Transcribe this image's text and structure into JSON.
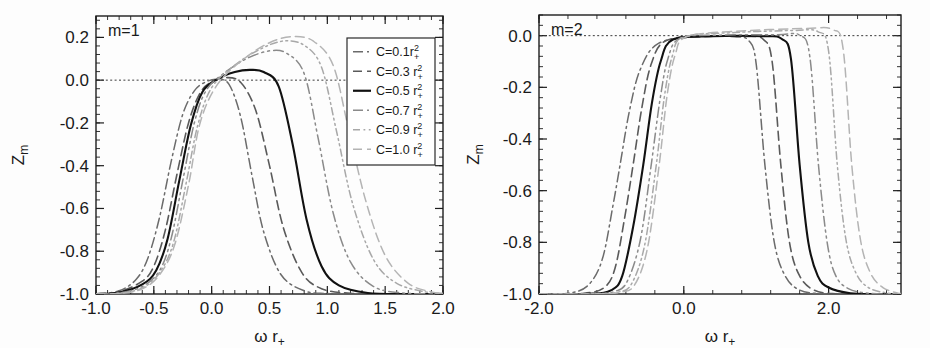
{
  "figure": {
    "type": "multi-panel-line-plot",
    "panels": 2,
    "background": "#ffffff",
    "ink": "#1d1d1d"
  },
  "chart_data": [
    {
      "type": "line",
      "panel_id": "left",
      "title": "m=1",
      "xlabel": "ω r₊",
      "ylabel": "Zₘ",
      "xlim": [
        -1.0,
        2.0
      ],
      "ylim": [
        -1.0,
        0.3
      ],
      "xticks": [
        -1.0,
        -0.5,
        0.0,
        0.5,
        1.0,
        1.5,
        2.0
      ],
      "xticklabels": [
        "-1.0",
        "-0.5",
        "0.0",
        "0.5",
        "1.0",
        "1.5",
        "2.0"
      ],
      "yticks": [
        0.2,
        0.0,
        -0.2,
        -0.4,
        -0.6,
        -0.8,
        -1.0
      ],
      "yticklabels": [
        "0.2",
        "0.0",
        "-0.2",
        "-0.4",
        "-0.6",
        "-0.8",
        "-1.0"
      ],
      "grid": false,
      "zero_reference_line": 0.0,
      "minor_ticks_per_major": 5,
      "legend_position": "upper-right",
      "series": [
        {
          "name": "C=0.1r₊²",
          "style": "dashdot",
          "color": "#6b6b6b",
          "width": 1.5,
          "rise_center": -0.4,
          "rise_width": 0.2,
          "peak_x": 0.05,
          "peak_y": 0.005,
          "fall_center": 0.28,
          "fall_width": 0.155,
          "points_x": [
            -1.0,
            -0.8,
            -0.65,
            -0.55,
            -0.45,
            -0.35,
            -0.25,
            -0.15,
            -0.05,
            0.05,
            0.15,
            0.25,
            0.35,
            0.45,
            0.6,
            0.8,
            1.0,
            1.3,
            1.6,
            2.0
          ],
          "points_y": [
            -1.0,
            -0.985,
            -0.93,
            -0.83,
            -0.64,
            -0.38,
            -0.16,
            -0.05,
            -0.008,
            0.004,
            -0.02,
            -0.17,
            -0.45,
            -0.71,
            -0.91,
            -0.985,
            -0.998,
            -1.0,
            -1.0,
            -1.0
          ]
        },
        {
          "name": "C=0.3 r₊²",
          "style": "dashed",
          "color": "#5a5a5a",
          "width": 1.6,
          "rise_center": -0.33,
          "rise_width": 0.185,
          "peak_x": 0.12,
          "peak_y": 0.012,
          "fall_center": 0.45,
          "fall_width": 0.175,
          "points_x": [
            -1.0,
            -0.8,
            -0.6,
            -0.5,
            -0.4,
            -0.3,
            -0.2,
            -0.1,
            0.0,
            0.12,
            0.25,
            0.38,
            0.5,
            0.62,
            0.78,
            0.95,
            1.2,
            1.5,
            2.0
          ],
          "points_y": [
            -1.0,
            -0.99,
            -0.94,
            -0.87,
            -0.7,
            -0.44,
            -0.2,
            -0.06,
            -0.008,
            0.012,
            -0.01,
            -0.14,
            -0.4,
            -0.69,
            -0.9,
            -0.975,
            -0.997,
            -1.0,
            -1.0
          ]
        },
        {
          "name": "C=0.5 r₊²",
          "style": "solid",
          "color": "#111111",
          "width": 2.1,
          "rise_center": -0.29,
          "rise_width": 0.175,
          "peak_x": 0.33,
          "peak_y": 0.048,
          "fall_center": 0.7,
          "fall_width": 0.19,
          "points_x": [
            -1.0,
            -0.8,
            -0.6,
            -0.48,
            -0.38,
            -0.28,
            -0.18,
            -0.08,
            0.05,
            0.2,
            0.33,
            0.45,
            0.58,
            0.7,
            0.82,
            0.95,
            1.1,
            1.35,
            1.7,
            2.0
          ],
          "points_y": [
            -1.0,
            -0.993,
            -0.955,
            -0.89,
            -0.74,
            -0.47,
            -0.21,
            -0.055,
            0.005,
            0.038,
            0.048,
            0.038,
            -0.03,
            -0.3,
            -0.65,
            -0.87,
            -0.96,
            -0.995,
            -1.0,
            -1.0
          ]
        },
        {
          "name": "C=0.7 r₊²",
          "style": "dashdotdot",
          "color": "#8a8a8a",
          "width": 1.5,
          "rise_center": -0.25,
          "rise_width": 0.165,
          "peak_x": 0.53,
          "peak_y": 0.138,
          "fall_center": 0.92,
          "fall_width": 0.195,
          "points_x": [
            -1.0,
            -0.8,
            -0.6,
            -0.45,
            -0.35,
            -0.25,
            -0.15,
            -0.05,
            0.1,
            0.3,
            0.5,
            0.65,
            0.8,
            0.92,
            1.05,
            1.2,
            1.4,
            1.65,
            2.0
          ],
          "points_y": [
            -1.0,
            -0.995,
            -0.965,
            -0.89,
            -0.74,
            -0.47,
            -0.2,
            -0.05,
            0.03,
            0.1,
            0.137,
            0.125,
            0.03,
            -0.27,
            -0.62,
            -0.85,
            -0.965,
            -0.995,
            -1.0
          ]
        },
        {
          "name": "C=0.9 r₊²",
          "style": "dashdotdotlight",
          "color": "#a8a8a8",
          "width": 1.5,
          "rise_center": -0.22,
          "rise_width": 0.16,
          "peak_x": 0.66,
          "peak_y": 0.185,
          "fall_center": 1.08,
          "fall_width": 0.2,
          "points_x": [
            -1.0,
            -0.8,
            -0.6,
            -0.45,
            -0.33,
            -0.22,
            -0.12,
            0.0,
            0.2,
            0.42,
            0.62,
            0.8,
            0.95,
            1.08,
            1.22,
            1.4,
            1.6,
            1.85,
            2.0
          ],
          "points_y": [
            -1.0,
            -0.997,
            -0.972,
            -0.9,
            -0.76,
            -0.48,
            -0.21,
            -0.035,
            0.07,
            0.145,
            0.183,
            0.163,
            0.06,
            -0.24,
            -0.58,
            -0.84,
            -0.95,
            -0.99,
            -0.997
          ]
        },
        {
          "name": "C=1.0 r₊²",
          "style": "dashedlight",
          "color": "#b4b4b4",
          "width": 1.5,
          "rise_center": -0.2,
          "rise_width": 0.155,
          "peak_x": 0.72,
          "peak_y": 0.205,
          "fall_center": 1.18,
          "fall_width": 0.205,
          "points_x": [
            -1.0,
            -0.8,
            -0.6,
            -0.45,
            -0.32,
            -0.2,
            -0.1,
            0.05,
            0.28,
            0.5,
            0.7,
            0.88,
            1.05,
            1.18,
            1.33,
            1.5,
            1.7,
            1.9,
            2.0
          ],
          "points_y": [
            -1.0,
            -0.998,
            -0.976,
            -0.91,
            -0.77,
            -0.49,
            -0.2,
            -0.02,
            0.1,
            0.175,
            0.204,
            0.182,
            0.07,
            -0.22,
            -0.56,
            -0.82,
            -0.95,
            -0.99,
            -0.995
          ]
        }
      ]
    },
    {
      "type": "line",
      "panel_id": "right",
      "title": "m=2",
      "xlabel": "ω r₊",
      "ylabel": "Zₘ",
      "xlim": [
        -2.0,
        3.0
      ],
      "ylim": [
        -1.0,
        0.08
      ],
      "xticks": [
        -2.0,
        0.0,
        2.0
      ],
      "xticklabels": [
        "-2.0",
        "0.0",
        "2.0"
      ],
      "yticks": [
        0.0,
        -0.2,
        -0.4,
        -0.6,
        -0.8,
        -1.0
      ],
      "yticklabels": [
        "0.0",
        "-0.2",
        "-0.4",
        "-0.6",
        "-0.8",
        "-1.0"
      ],
      "grid": false,
      "zero_reference_line": 0.0,
      "minor_ticks_per_major": 5,
      "legend_position": "none",
      "series": [
        {
          "name": "C=0.1r₊²",
          "style": "dashdot",
          "color": "#6b6b6b",
          "width": 1.5,
          "rise_center": -0.88,
          "rise_width": 0.2,
          "plateau_y": -0.004,
          "fall_center": 1.12,
          "fall_width": 0.215,
          "points_x": [
            -2.0,
            -1.55,
            -1.3,
            -1.12,
            -0.98,
            -0.88,
            -0.75,
            -0.6,
            -0.35,
            0.2,
            0.7,
            0.9,
            1.0,
            1.12,
            1.25,
            1.4,
            1.6,
            1.9,
            2.4,
            3.0
          ],
          "points_y": [
            -1.0,
            -0.995,
            -0.96,
            -0.86,
            -0.66,
            -0.5,
            -0.29,
            -0.13,
            -0.03,
            -0.004,
            -0.004,
            -0.02,
            -0.11,
            -0.5,
            -0.8,
            -0.93,
            -0.985,
            -0.999,
            -1.0,
            -1.0
          ]
        },
        {
          "name": "C=0.3 r₊²",
          "style": "dashed",
          "color": "#5a5a5a",
          "width": 1.6,
          "rise_center": -0.7,
          "rise_width": 0.165,
          "plateau_y": -0.003,
          "fall_center": 1.34,
          "fall_width": 0.2,
          "points_x": [
            -2.0,
            -1.4,
            -1.1,
            -0.95,
            -0.82,
            -0.7,
            -0.58,
            -0.45,
            -0.25,
            0.3,
            0.9,
            1.1,
            1.22,
            1.34,
            1.46,
            1.6,
            1.8,
            2.1,
            2.6,
            3.0
          ],
          "points_y": [
            -1.0,
            -0.998,
            -0.975,
            -0.9,
            -0.71,
            -0.5,
            -0.28,
            -0.11,
            -0.02,
            -0.003,
            -0.003,
            -0.015,
            -0.1,
            -0.5,
            -0.8,
            -0.93,
            -0.985,
            -0.999,
            -1.0,
            -1.0
          ]
        },
        {
          "name": "C=0.5 r₊²",
          "style": "solid",
          "color": "#111111",
          "width": 2.1,
          "rise_center": -0.56,
          "rise_width": 0.15,
          "plateau_y": -0.002,
          "fall_center": 1.6,
          "fall_width": 0.185,
          "points_x": [
            -2.0,
            -1.3,
            -1.0,
            -0.85,
            -0.7,
            -0.56,
            -0.44,
            -0.32,
            -0.15,
            0.4,
            1.1,
            1.35,
            1.48,
            1.6,
            1.72,
            1.85,
            2.0,
            2.3,
            2.7,
            3.0
          ],
          "points_y": [
            -1.0,
            -0.999,
            -0.985,
            -0.93,
            -0.74,
            -0.5,
            -0.26,
            -0.1,
            -0.015,
            -0.002,
            -0.002,
            -0.012,
            -0.09,
            -0.5,
            -0.8,
            -0.93,
            -0.975,
            -0.997,
            -1.0,
            -1.0
          ]
        },
        {
          "name": "C=0.7 r₊²",
          "style": "dashdotdot",
          "color": "#8a8a8a",
          "width": 1.5,
          "rise_center": -0.45,
          "rise_width": 0.145,
          "plateau_y": 0.002,
          "fall_center": 1.86,
          "fall_width": 0.185,
          "points_x": [
            -2.0,
            -1.25,
            -0.95,
            -0.78,
            -0.6,
            -0.45,
            -0.33,
            -0.22,
            -0.05,
            0.5,
            1.3,
            1.6,
            1.74,
            1.86,
            1.98,
            2.1,
            2.28,
            2.55,
            2.85,
            3.0
          ],
          "points_y": [
            -1.0,
            -0.999,
            -0.99,
            -0.95,
            -0.79,
            -0.5,
            -0.25,
            -0.09,
            -0.01,
            0.002,
            0.004,
            0.002,
            -0.08,
            -0.5,
            -0.8,
            -0.93,
            -0.98,
            -0.997,
            -1.0,
            -1.0
          ]
        },
        {
          "name": "C=0.9 r₊²",
          "style": "dashdotdotlight",
          "color": "#a8a8a8",
          "width": 1.5,
          "rise_center": -0.38,
          "rise_width": 0.14,
          "plateau_y": 0.012,
          "fall_center": 2.12,
          "fall_width": 0.19,
          "points_x": [
            -2.0,
            -1.2,
            -0.9,
            -0.72,
            -0.54,
            -0.38,
            -0.27,
            -0.16,
            0.0,
            0.7,
            1.5,
            1.85,
            2.0,
            2.12,
            2.24,
            2.38,
            2.55,
            2.8,
            3.0
          ],
          "points_y": [
            -1.0,
            -0.999,
            -0.992,
            -0.96,
            -0.81,
            -0.5,
            -0.24,
            -0.08,
            -0.005,
            0.012,
            0.02,
            0.016,
            -0.06,
            -0.5,
            -0.79,
            -0.92,
            -0.975,
            -0.996,
            -1.0
          ]
        },
        {
          "name": "C=1.0 r₊²",
          "style": "dashedlight",
          "color": "#b4b4b4",
          "width": 1.5,
          "rise_center": -0.34,
          "rise_width": 0.14,
          "plateau_y": 0.018,
          "fall_center": 2.32,
          "fall_width": 0.19,
          "points_x": [
            -2.0,
            -1.18,
            -0.88,
            -0.68,
            -0.5,
            -0.34,
            -0.23,
            -0.12,
            0.05,
            0.8,
            1.7,
            2.05,
            2.2,
            2.32,
            2.44,
            2.58,
            2.75,
            2.95,
            3.0
          ],
          "points_y": [
            -1.0,
            -1.0,
            -0.993,
            -0.965,
            -0.82,
            -0.5,
            -0.23,
            -0.075,
            -0.003,
            0.018,
            0.028,
            0.024,
            -0.05,
            -0.5,
            -0.79,
            -0.92,
            -0.975,
            -0.996,
            -0.998
          ]
        }
      ]
    }
  ],
  "legend": {
    "box_label": "curve-legend",
    "entries": [
      {
        "prefix": "C=0.1",
        "symbol": "r",
        "sub": "+",
        "sup": "2",
        "style": "dashdot",
        "color": "#6b6b6b"
      },
      {
        "prefix": "C=0.3 ",
        "symbol": "r",
        "sub": "+",
        "sup": "2",
        "style": "dashed",
        "color": "#5a5a5a"
      },
      {
        "prefix": "C=0.5 ",
        "symbol": "r",
        "sub": "+",
        "sup": "2",
        "style": "solid",
        "color": "#111111"
      },
      {
        "prefix": "C=0.7 ",
        "symbol": "r",
        "sub": "+",
        "sup": "2",
        "style": "dashdotdot",
        "color": "#8a8a8a"
      },
      {
        "prefix": "C=0.9 ",
        "symbol": "r",
        "sub": "+",
        "sup": "2",
        "style": "dashdotdotlight",
        "color": "#a8a8a8"
      },
      {
        "prefix": "C=1.0 ",
        "symbol": "r",
        "sub": "+",
        "sup": "2",
        "style": "dashedlight",
        "color": "#b4b4b4"
      }
    ]
  }
}
